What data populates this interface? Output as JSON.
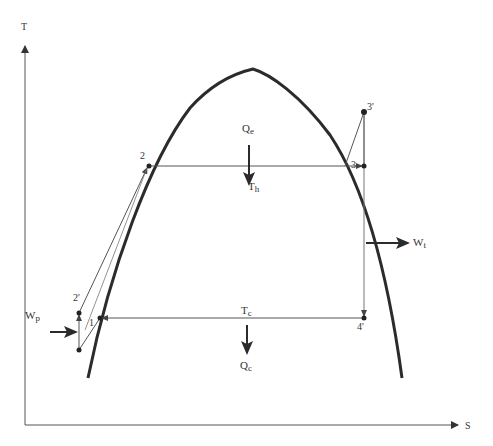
{
  "diagram": {
    "type": "T-s diagram (Rankine cycle)",
    "axes": {
      "y_label": "T",
      "x_label": "S"
    },
    "points": [
      {
        "id": "1",
        "label": "1"
      },
      {
        "id": "2",
        "label": "2"
      },
      {
        "id": "2p",
        "label": "2'"
      },
      {
        "id": "3",
        "label": "3"
      },
      {
        "id": "3p",
        "label": "3'"
      },
      {
        "id": "4p",
        "label": "4'"
      }
    ],
    "heat_in": {
      "main": "Q",
      "sub": "e"
    },
    "heat_out": {
      "main": "Q",
      "sub": "c"
    },
    "hot_temp": {
      "main": "T",
      "sub": "h"
    },
    "cold_temp": {
      "main": "T",
      "sub": "c"
    },
    "turbine_work": {
      "main": "W",
      "sub": "t"
    },
    "pump_work": {
      "main": "W",
      "sub": "p"
    },
    "colors": {
      "dome": "#2b2b2b",
      "lines": "#555555",
      "text": "#333333",
      "background": "#ffffff"
    }
  }
}
